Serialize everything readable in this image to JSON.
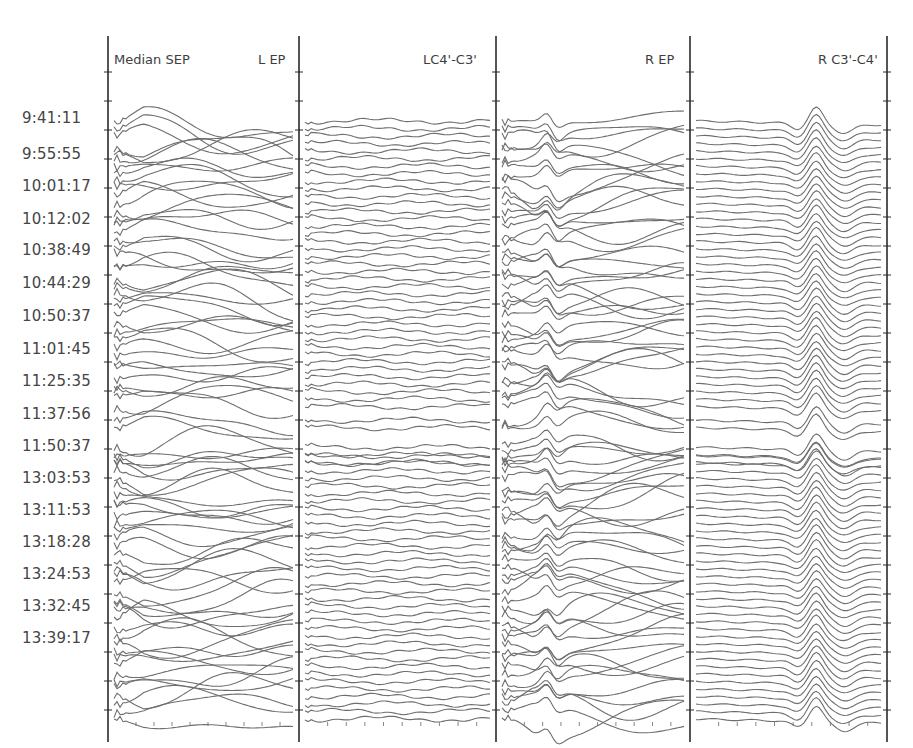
{
  "chart_data": {
    "type": "line",
    "title": "Median SEP",
    "subtitle": "",
    "xlabel": "",
    "ylabel": "",
    "grid": false,
    "legend_position": "none",
    "panels": [
      {
        "label": "L EP",
        "channel": "left-ep",
        "style": "nerve-left"
      },
      {
        "label": "LC4'-C3'",
        "channel": "left-cortical",
        "style": "flat"
      },
      {
        "label": "R EP",
        "channel": "right-ep",
        "style": "nerve-right"
      },
      {
        "label": "R C3'-C4'",
        "channel": "right-cortical",
        "style": "cortical-peak"
      }
    ],
    "row_labels": [
      "9:41:11",
      "9:55:55",
      "10:01:17",
      "10:12:02",
      "10:38:49",
      "10:44:29",
      "10:50:37",
      "11:01:45",
      "11:25:35",
      "11:37:56",
      "11:50:37",
      "13:03:53",
      "13:11:53",
      "13:18:28",
      "13:24:53",
      "13:32:45",
      "13:39:17"
    ],
    "row_label_y": [
      118,
      154,
      186,
      219,
      250,
      283,
      316,
      349,
      381,
      414,
      446,
      478,
      510,
      542,
      574,
      606,
      638
    ],
    "traces_per_panel": 80,
    "trace_y_start": 121,
    "trace_y_end": 715,
    "cortical_peak_x_fraction": 0.65,
    "cortical_trough_x_fraction": 0.55,
    "x_ticks_per_panel": 9,
    "y_tick_spacing": 29,
    "colors": {
      "background": "#ffffff",
      "trace": "#6e6e6e",
      "axis": "#2a2a2a",
      "label": "#454545"
    }
  },
  "header": {
    "title": "Median SEP",
    "panel_labels": [
      "L EP",
      "LC4'-C3'",
      "R EP",
      "R C3'-C4'"
    ]
  },
  "axes": {
    "vertical_lines_x": [
      108,
      299,
      496,
      690,
      887
    ],
    "top": 36,
    "bottom": 742,
    "x_tick_y": 722
  }
}
